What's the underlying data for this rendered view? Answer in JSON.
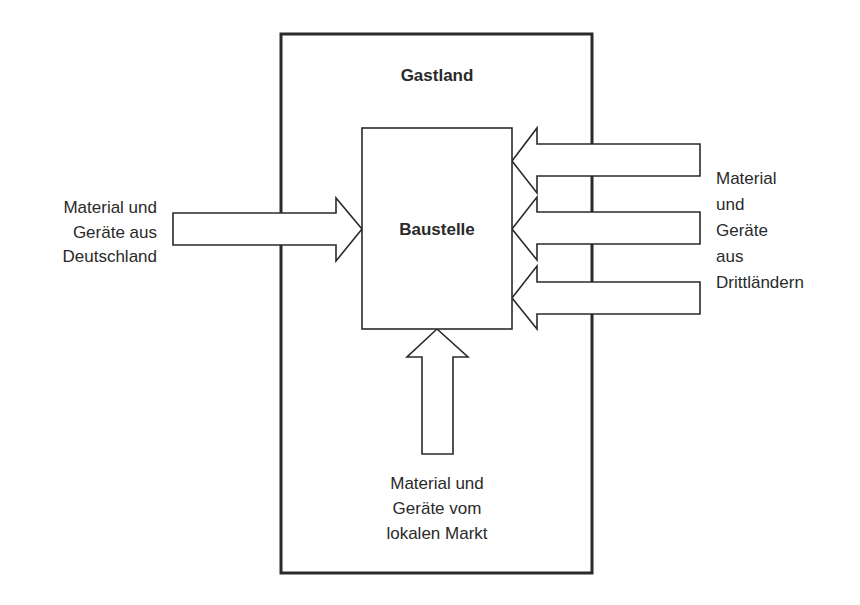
{
  "diagram": {
    "outer_box": {
      "label": "Gastland"
    },
    "inner_box": {
      "label": "Baustelle"
    },
    "sources": {
      "left": {
        "lines": [
          "Material und",
          "Geräte aus",
          "Deutschland"
        ]
      },
      "right": {
        "lines": [
          "Material",
          "und",
          "Geräte",
          "aus",
          "Drittländern"
        ]
      },
      "bottom": {
        "lines": [
          "Material und",
          "Geräte vom",
          "lokalen Markt"
        ]
      }
    },
    "arrows": [
      {
        "from": "Deutschland",
        "to": "Baustelle",
        "direction": "right"
      },
      {
        "from": "Drittländer",
        "to": "Baustelle",
        "direction": "left"
      },
      {
        "from": "Drittländer",
        "to": "Baustelle",
        "direction": "left"
      },
      {
        "from": "Drittländer",
        "to": "Baustelle",
        "direction": "left"
      },
      {
        "from": "lokaler Markt",
        "to": "Baustelle",
        "direction": "up"
      }
    ]
  }
}
